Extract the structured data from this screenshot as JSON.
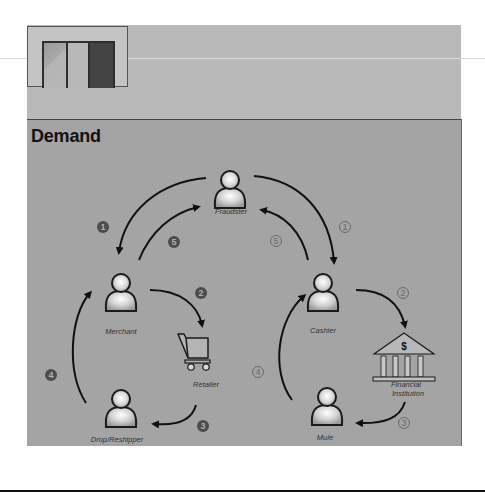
{
  "title": "Demand",
  "thumbnail": {
    "panels": 3,
    "highlighted_panel": 3
  },
  "nodes": {
    "fraudster": {
      "label": "Fraudster",
      "icon": "person-icon"
    },
    "merchant": {
      "label": "Merchant",
      "icon": "person-icon"
    },
    "retailer": {
      "label": "Retailer",
      "icon": "shopping-cart-icon"
    },
    "drop_reshipper": {
      "label": "Drop/Reshipper",
      "icon": "person-icon"
    },
    "cashier": {
      "label": "Cashier",
      "icon": "person-icon"
    },
    "financial_institution": {
      "label": "Financial\nInstitution",
      "label_line1": "Financial",
      "label_line2": "Institution",
      "icon": "bank-icon",
      "icon_glyph": "$"
    },
    "mule": {
      "label": "Mule",
      "icon": "person-icon"
    }
  },
  "left_cycle_steps": {
    "s1": "1",
    "s2": "2",
    "s3": "3",
    "s4": "4",
    "s5": "5",
    "style": "filled-circle"
  },
  "right_cycle_steps": {
    "s1": "1",
    "s2": "2",
    "s3": "3",
    "s4": "4",
    "s5": "5",
    "style": "outlined-circle"
  },
  "flows": [
    {
      "step": 1,
      "cycle": "left",
      "from": "Fraudster",
      "to": "Merchant"
    },
    {
      "step": 2,
      "cycle": "left",
      "from": "Merchant",
      "to": "Retailer"
    },
    {
      "step": 3,
      "cycle": "left",
      "from": "Retailer",
      "to": "Drop/Reshipper"
    },
    {
      "step": 4,
      "cycle": "left",
      "from": "Drop/Reshipper",
      "to": "Merchant"
    },
    {
      "step": 5,
      "cycle": "left",
      "from": "Merchant",
      "to": "Fraudster"
    },
    {
      "step": 1,
      "cycle": "right",
      "from": "Fraudster",
      "to": "Cashier"
    },
    {
      "step": 2,
      "cycle": "right",
      "from": "Cashier",
      "to": "Financial Institution"
    },
    {
      "step": 3,
      "cycle": "right",
      "from": "Financial Institution",
      "to": "Mule"
    },
    {
      "step": 4,
      "cycle": "right",
      "from": "Mule",
      "to": "Cashier"
    },
    {
      "step": 5,
      "cycle": "right",
      "from": "Cashier",
      "to": "Fraudster"
    }
  ],
  "colors": {
    "panel_bg": "#a4a4a4",
    "top_band_bg": "#b9b9b9",
    "arrow": "#111111",
    "filled_step": "#4c4c4c"
  }
}
